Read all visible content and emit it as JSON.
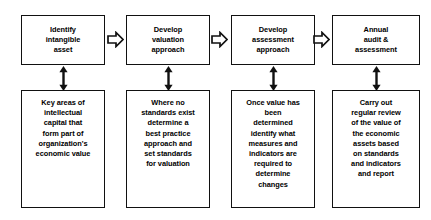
{
  "diagram": {
    "background_color": "#ffffff",
    "line_color": "#111111",
    "text_color": "#000000",
    "columns": [
      {
        "id": "identify-intangible-asset",
        "step_label": "Identify\nintangible\nasset",
        "detail_label": "Key areas of\nintellectual\ncapital that\nform part of\norganization's\neconomic value",
        "connector_down": "double-headed-vertical-arrow",
        "connector_right": "block-arrow-right"
      },
      {
        "id": "develop-valuation-approach",
        "step_label": "Develop\nvaluation\napproach",
        "detail_label": "Where no\nstandards exist\ndetermine a\nbest practice\napproach and\nset standards\nfor valuation",
        "connector_down": "double-headed-vertical-arrow",
        "connector_right": "block-arrow-right"
      },
      {
        "id": "develop-assessment-approach",
        "step_label": "Develop\nassessment\napproach",
        "detail_label": "Once value has\nbeen\ndetermined\nidentify what\nmeasures and\nindicators are\nrequired to\ndetermine\nchanges",
        "connector_down": "double-headed-vertical-arrow",
        "connector_right": "block-arrow-right"
      },
      {
        "id": "annual-audit-assessment",
        "step_label": "Annual\naudit &\nassessment",
        "detail_label": "Carry out\nregular review\nof the value of\nthe economic\nassets based\non standards\nand indicators\nand report",
        "connector_down": "double-headed-vertical-arrow",
        "connector_right": null
      }
    ]
  }
}
